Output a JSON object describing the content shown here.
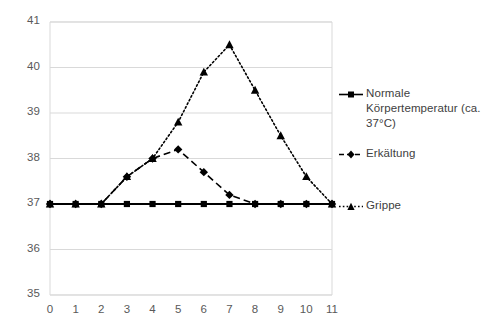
{
  "chart_data": {
    "type": "line",
    "title": "",
    "xlabel": "",
    "ylabel": "",
    "x": [
      0,
      1,
      2,
      3,
      4,
      5,
      6,
      7,
      8,
      9,
      10,
      11
    ],
    "xtick_labels": [
      "0",
      "1",
      "2",
      "3",
      "4",
      "5",
      "6",
      "7",
      "8",
      "9",
      "10",
      "11"
    ],
    "ytick_labels": [
      "41",
      "40",
      "39",
      "38",
      "37",
      "36",
      "35"
    ],
    "ylim": [
      35,
      41
    ],
    "xlim": [
      0,
      11
    ],
    "grid": "horizontal",
    "legend_position": "right",
    "series": [
      {
        "name": "Normale Körpertemperatur (ca. 37°C)",
        "marker": "square",
        "line_style": "solid",
        "color": "#000000",
        "values": [
          37,
          37,
          37,
          37,
          37,
          37,
          37,
          37,
          37,
          37,
          37,
          37
        ]
      },
      {
        "name": "Erkältung",
        "marker": "diamond",
        "line_style": "dashed",
        "color": "#000000",
        "values": [
          37,
          37,
          37,
          37.6,
          38.0,
          38.2,
          37.7,
          37.2,
          37,
          37,
          37,
          37
        ]
      },
      {
        "name": "Grippe",
        "marker": "triangle",
        "line_style": "dotted",
        "color": "#000000",
        "values": [
          37,
          37,
          37,
          37.6,
          38.0,
          38.8,
          39.9,
          40.5,
          39.5,
          38.5,
          37.6,
          37.0
        ]
      }
    ]
  },
  "legend": {
    "entries": [
      {
        "label": "Normale Körpertemperatur (ca. 37°C)",
        "marker": "square-marker",
        "style": "solid"
      },
      {
        "label": "Erkältung",
        "marker": "diamond-marker",
        "style": "dashed"
      },
      {
        "label": "Grippe",
        "marker": "triangle-marker",
        "style": "dotted"
      }
    ]
  },
  "colors": {
    "series": "#000000",
    "gridline": "#d9d9d9",
    "axis": "#d9d9d9",
    "tick_text": "#595959",
    "legend_text": "#404040",
    "background": "#ffffff"
  }
}
